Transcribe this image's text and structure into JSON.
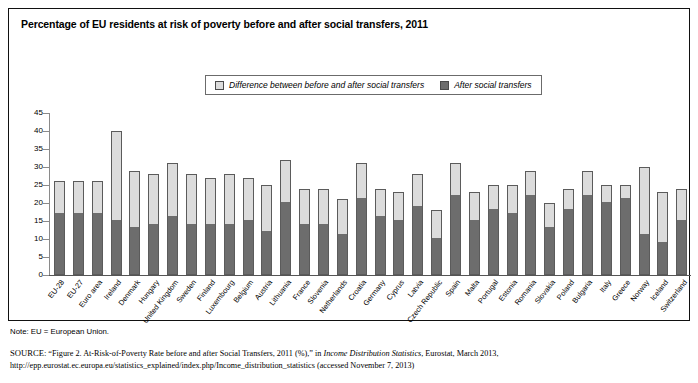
{
  "figure": {
    "title": "Percentage of EU residents at risk of poverty before and after social transfers, 2011",
    "note": "Note: EU = European Union.",
    "source_label": "SOURCE:",
    "source_part1": "“Figure 2. At-Risk-of-Poverty Rate before and after Social Transfers, 2011 (%),” in ",
    "source_italic": "Income Distribution Statistics",
    "source_part2": ", Eurostat, March 2013, http://epp.eurostat.ec.europa.eu/statistics_explained/index.php/Income_distribution_statistics (accessed November 7, 2013)"
  },
  "legend": {
    "items": [
      {
        "label": "Difference between before and after social transfers",
        "swatch": "light",
        "color": "#dcdcdc"
      },
      {
        "label": "After social transfers",
        "swatch": "dark",
        "color": "#6d6d6d"
      }
    ]
  },
  "colors": {
    "before_transfers": "#dcdcdc",
    "after_transfers": "#6d6d6d",
    "axis": "#555555",
    "border": "#111111"
  },
  "chart_data": {
    "type": "bar",
    "stacked": true,
    "title": "Percentage of EU residents at risk of poverty before and after social transfers, 2011",
    "xlabel": "",
    "ylabel": "",
    "ylim": [
      0,
      45
    ],
    "yticks": [
      0,
      5,
      10,
      15,
      20,
      25,
      30,
      35,
      40,
      45
    ],
    "grid": false,
    "legend_position": "top-center",
    "categories": [
      "EU-28",
      "EU-27",
      "Euro area",
      "Ireland",
      "Denmark",
      "Hungary",
      "United Kingdom",
      "Sweden",
      "Finland",
      "Luxembourg",
      "Belgium",
      "Austria",
      "Lithuania",
      "France",
      "Slovenia",
      "Netherlands",
      "Croatia",
      "Germany",
      "Cyprus",
      "Latvia",
      "Czech Republic",
      "Spain",
      "Malta",
      "Portugal",
      "Estonia",
      "Romania",
      "Slovakia",
      "Poland",
      "Bulgaria",
      "Italy",
      "Greece",
      "Norway",
      "Iceland",
      "Switzerland"
    ],
    "series": [
      {
        "name": "After social transfers",
        "values": [
          17,
          17,
          17,
          15,
          13,
          14,
          16,
          14,
          14,
          14,
          15,
          12,
          20,
          14,
          14,
          11,
          21,
          16,
          15,
          19,
          10,
          22,
          15,
          18,
          17,
          22,
          13,
          18,
          22,
          20,
          21,
          11,
          9,
          15
        ]
      },
      {
        "name": "Difference between before and after social transfers",
        "values": [
          9,
          9,
          9,
          25,
          16,
          14,
          15,
          14,
          13,
          14,
          12,
          13,
          12,
          10,
          10,
          10,
          10,
          8,
          8,
          9,
          8,
          9,
          8,
          7,
          8,
          7,
          7,
          6,
          7,
          5,
          4,
          19,
          14,
          9
        ]
      }
    ],
    "before_transfers_totals": [
      26,
      26,
      26,
      40,
      29,
      28,
      31,
      28,
      27,
      28,
      27,
      25,
      32,
      24,
      24,
      21,
      31,
      24,
      23,
      28,
      18,
      31,
      23,
      25,
      25,
      29,
      20,
      24,
      29,
      25,
      25,
      30,
      23,
      24
    ]
  }
}
